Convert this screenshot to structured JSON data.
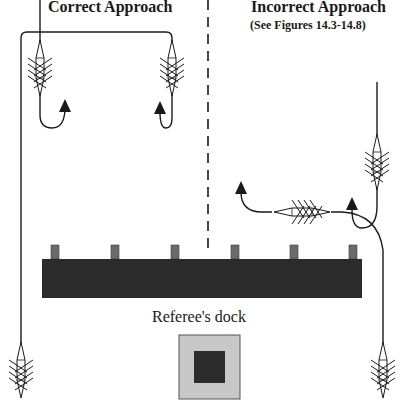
{
  "diagram": {
    "left_panel": {
      "title": "Correct Approach"
    },
    "right_panel": {
      "title": "Incorrect Approach",
      "subtitle": "(See Figures 14.3-14.8)"
    },
    "main_dock": {
      "post_count": 6,
      "color": "#2b2b2b",
      "post_color": "#6b6b6b"
    },
    "referee_dock": {
      "label": "Referee's dock",
      "outer_color": "#c8c8c8",
      "inner_color": "#2b2b2b"
    },
    "divider": {
      "style": "dashed"
    }
  }
}
